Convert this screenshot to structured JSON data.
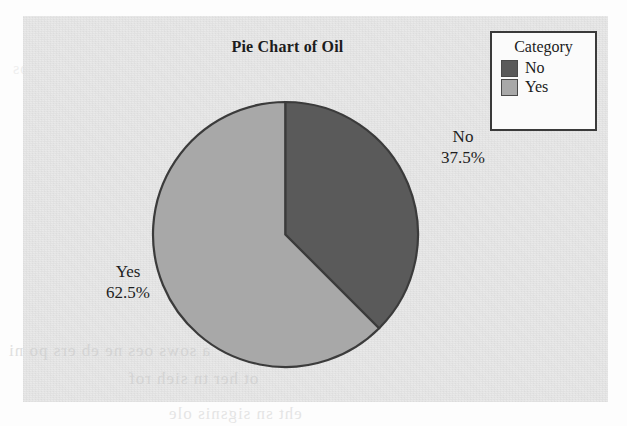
{
  "chart_data": {
    "type": "pie",
    "title": "Pie Chart of Oil",
    "categories": [
      "No",
      "Yes"
    ],
    "values": [
      37.5,
      62.5
    ],
    "labels": [
      {
        "name": "No",
        "percent": "37.5%"
      },
      {
        "name": "Yes",
        "percent": "62.5%"
      }
    ],
    "colors": [
      "#5a5a5a",
      "#a8a8a8"
    ],
    "legend": {
      "title": "Category",
      "position": "top-right",
      "entries": [
        {
          "label": "No",
          "color": "#5a5a5a"
        },
        {
          "label": "Yes",
          "color": "#a8a8a8"
        }
      ]
    },
    "start_angle": 0,
    "direction": "clockwise",
    "grid": false,
    "xlabel": "",
    "ylabel": ""
  },
  "panel": {
    "background_color": "#e9e9e9",
    "border_color": "#3a3a3a"
  },
  "artifact_text": {
    "line1": "a sows oes ne eb ers po ni",
    "line2": "ot her tn sieh rof",
    "line3": "eht sn sigsnis ole",
    "line4": "ods ano ni teos"
  }
}
